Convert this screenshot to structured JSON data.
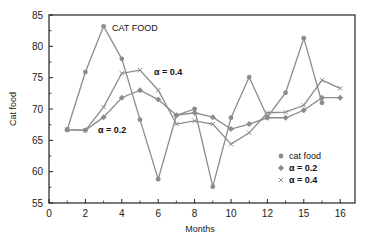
{
  "chart_data": {
    "type": "line",
    "title": "",
    "xlabel": "Months",
    "ylabel": "Cat food",
    "xlim": [
      0,
      17
    ],
    "ylim": [
      55,
      85
    ],
    "grid": false,
    "legend_position": "lower right",
    "x_ticks": [
      0,
      2,
      4,
      6,
      8,
      10,
      12,
      14,
      16
    ],
    "x_tick_labels": [
      "0",
      "2",
      "4",
      "6",
      "8",
      "10",
      "12",
      "15",
      "16"
    ],
    "y_ticks": [
      55,
      60,
      65,
      70,
      75,
      80,
      85
    ],
    "y_tick_labels": [
      "55",
      "60",
      "65",
      "70",
      "75",
      "80",
      "85"
    ],
    "x": [
      1,
      2,
      3,
      4,
      5,
      6,
      7,
      8,
      9,
      10,
      11,
      12,
      13,
      14,
      15,
      16
    ],
    "series": [
      {
        "name": "cat food",
        "marker": "dot",
        "values": [
          66.7,
          75.9,
          83.2,
          78.0,
          68.3,
          58.8,
          69.0,
          70.0,
          57.6,
          68.6,
          75.1,
          68.7,
          72.6,
          81.3,
          71.0,
          null
        ]
      },
      {
        "name": "α = 0.2",
        "marker": "diamond",
        "values": [
          66.7,
          66.6,
          68.7,
          71.8,
          73.0,
          71.5,
          69.0,
          69.4,
          68.7,
          66.8,
          67.6,
          68.6,
          68.6,
          69.8,
          71.8,
          71.8
        ]
      },
      {
        "name": "α = 0.4",
        "marker": "x",
        "values": [
          66.7,
          66.6,
          70.3,
          75.7,
          76.2,
          73.0,
          67.6,
          68.1,
          67.6,
          64.4,
          66.2,
          69.4,
          69.5,
          70.6,
          74.6,
          73.3
        ]
      }
    ],
    "annotations": [
      {
        "text": "CAT FOOD",
        "x": 3.6,
        "y": 83
      },
      {
        "text": "α = 0.4",
        "x": 6.0,
        "y": 75.6
      },
      {
        "text": "α = 0.2",
        "x": 3.0,
        "y": 66.3
      }
    ]
  },
  "labels": {
    "xlabel": "Months",
    "ylabel": "Cat food",
    "annot_catfood": "CAT FOOD",
    "annot_a04": "α = 0.4",
    "annot_a02": "α = 0.2",
    "legend": [
      "cat food",
      "α = 0.2",
      "α = 0.4"
    ]
  },
  "colors": {
    "series": "#8c8c8c",
    "axis": "#222222"
  }
}
